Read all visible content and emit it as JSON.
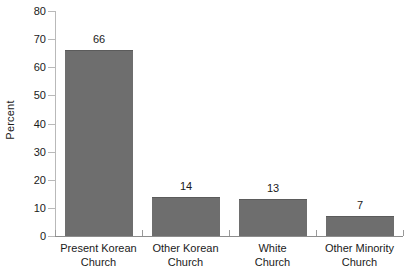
{
  "chart_data": {
    "type": "bar",
    "title": "",
    "xlabel": "",
    "ylabel": "Percent",
    "ylim": [
      0,
      80
    ],
    "yticks": [
      0,
      10,
      20,
      30,
      40,
      50,
      60,
      70,
      80
    ],
    "grid": false,
    "legend": null,
    "categories": [
      "Present Korean Church",
      "Other Korean Church",
      "White Church",
      "Other Minority Church"
    ],
    "category_lines": [
      [
        "Present Korean",
        "Church"
      ],
      [
        "Other Korean",
        "Church"
      ],
      [
        "White",
        "Church"
      ],
      [
        "Other Minority",
        "Church"
      ]
    ],
    "values": [
      66,
      14,
      13,
      7
    ],
    "data_labels": [
      "66",
      "14",
      "13",
      "7"
    ],
    "colors": {
      "bar_fill": "#6e6e6e",
      "bar_edge": "#5b5b5b",
      "axis": "#8d8d8d",
      "text": "#1a1a1a",
      "background": "#ffffff"
    }
  },
  "axis": {
    "y_tick_labels": [
      "80",
      "70",
      "60",
      "50",
      "40",
      "30",
      "20",
      "10",
      "0"
    ],
    "y_title": "Percent"
  }
}
